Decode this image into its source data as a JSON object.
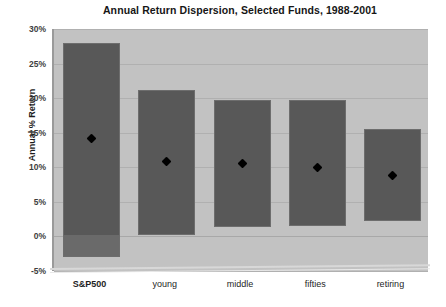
{
  "chart_data": {
    "type": "bar",
    "title": "Annual Return Dispersion, Selected Funds, 1988-2001",
    "xlabel": "",
    "ylabel": "Annual % Return",
    "categories": [
      "S&P500",
      "young",
      "middle",
      "fifties",
      "retiring"
    ],
    "ylim": [
      -5,
      30
    ],
    "ytick_labels": [
      "30%",
      "25%",
      "20%",
      "15%",
      "10%",
      "5%",
      "0%",
      "-5%"
    ],
    "ytick_values": [
      30,
      25,
      20,
      15,
      10,
      5,
      0,
      -5
    ],
    "grid": true,
    "legend": "none",
    "series": [
      {
        "name": "Return range (high-low)",
        "type": "range",
        "high": [
          28.0,
          21.2,
          19.8,
          19.8,
          15.5
        ],
        "low": [
          -3.0,
          0.2,
          1.4,
          1.5,
          2.3
        ]
      },
      {
        "name": "Mean annual return",
        "type": "marker",
        "values": [
          14.2,
          10.8,
          10.6,
          10.0,
          8.8
        ]
      }
    ],
    "colors": {
      "bar": "#585858",
      "bar_below_zero": "#6a6a6a",
      "marker": "#000000",
      "plot_background": "#c2c2c2",
      "gridline": "#b0b0b0",
      "page_background": "#ffffff"
    }
  }
}
